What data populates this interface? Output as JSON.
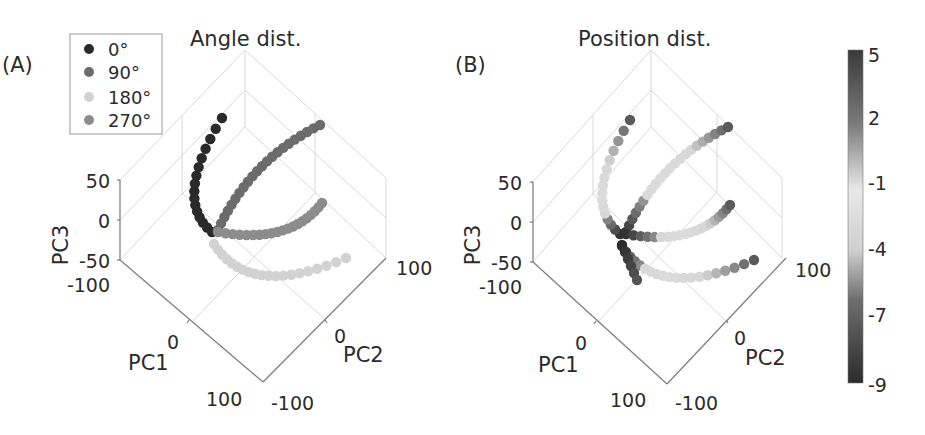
{
  "figure": {
    "panels": [
      {
        "id": "A",
        "label": "(A)",
        "title": "Angle dist.",
        "axes": {
          "pc3": {
            "label": "PC3",
            "ticks": [
              "50",
              "0",
              "-50"
            ]
          },
          "pc1": {
            "label": "PC1",
            "ticks": [
              "-100",
              "0",
              "100"
            ]
          },
          "pc2": {
            "label": "PC2",
            "ticks": [
              "-100",
              "0",
              "100"
            ]
          }
        },
        "legend": [
          {
            "label": "0°",
            "color": "#2a2a2a"
          },
          {
            "label": "90°",
            "color": "#6b6b6b"
          },
          {
            "label": "180°",
            "color": "#d2d2d2"
          },
          {
            "label": "270°",
            "color": "#8c8c8c"
          }
        ]
      },
      {
        "id": "B",
        "label": "(B)",
        "title": "Position dist.",
        "axes": {
          "pc3": {
            "label": "PC3",
            "ticks": [
              "50",
              "0",
              "-50"
            ]
          },
          "pc1": {
            "label": "PC1",
            "ticks": [
              "-100",
              "0",
              "100"
            ]
          },
          "pc2": {
            "label": "PC2",
            "ticks": [
              "-100",
              "0",
              "100"
            ]
          }
        },
        "colorbar": {
          "ticks": [
            "5",
            "2",
            "-1",
            "-4",
            "-7",
            "-9"
          ],
          "min": -9,
          "max": 5,
          "colors": {
            "high": "#3a3a3a",
            "mid": "#e6e6e6",
            "low": "#2e2e2e"
          }
        }
      }
    ]
  },
  "chart_data": [
    {
      "type": "scatter",
      "title": "Angle dist.",
      "panel": "(A)",
      "projection": "3d",
      "xlabel": "PC1",
      "ylabel": "PC2",
      "zlabel": "PC3",
      "xlim": [
        -100,
        100
      ],
      "ylim": [
        -100,
        100
      ],
      "zlim": [
        -50,
        50
      ],
      "x_ticks": [
        -100,
        0,
        100
      ],
      "y_ticks": [
        -100,
        0,
        100
      ],
      "z_ticks": [
        -50,
        0,
        50
      ],
      "grid": true,
      "legend_position": "upper left",
      "legend": [
        "0°",
        "90°",
        "180°",
        "270°"
      ],
      "series": [
        {
          "name": "0°",
          "color": "#2a2a2a",
          "description": "arc from shared origin rising up-left to top"
        },
        {
          "name": "90°",
          "color": "#6b6b6b",
          "description": "arc from origin rising up-right diagonally"
        },
        {
          "name": "180°",
          "color": "#d2d2d2",
          "description": "arc from origin descending below then curving right"
        },
        {
          "name": "270°",
          "color": "#8c8c8c",
          "description": "arc from origin extending right then up-right"
        }
      ]
    },
    {
      "type": "scatter",
      "title": "Position dist.",
      "panel": "(B)",
      "projection": "3d",
      "xlabel": "PC1",
      "ylabel": "PC2",
      "zlabel": "PC3",
      "xlim": [
        -100,
        100
      ],
      "ylim": [
        -100,
        100
      ],
      "zlim": [
        -50,
        50
      ],
      "x_ticks": [
        -100,
        0,
        100
      ],
      "y_ticks": [
        -100,
        0,
        100
      ],
      "z_ticks": [
        -50,
        0,
        50
      ],
      "grid": true,
      "colorbar": {
        "ticks": [
          5,
          2,
          -1,
          -4,
          -7,
          -9
        ],
        "range": [
          -9,
          5
        ]
      },
      "description": "Same four arcs colored by position; dark near shared origin and at arc ends, light in the middle"
    }
  ]
}
